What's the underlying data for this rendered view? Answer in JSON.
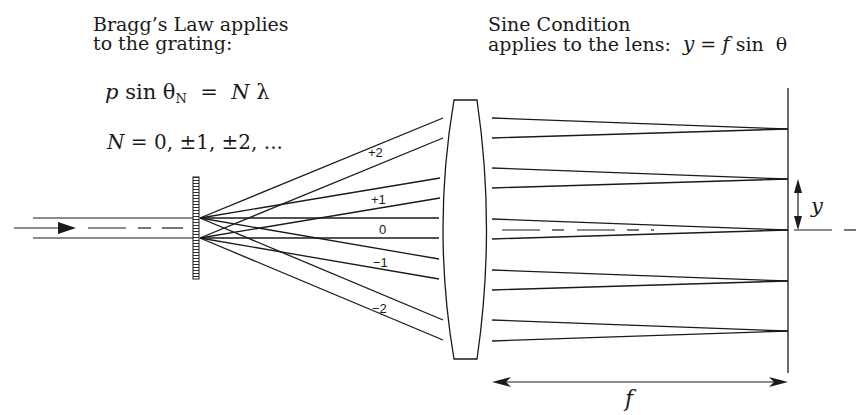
{
  "captions": {
    "bragg_line1": "Bragg’s Law applies",
    "bragg_line2": "to the grating:",
    "sine_line1": "Sine Condition",
    "sine_line2": "applies to the lens:"
  },
  "equations": {
    "bragg": {
      "p": "p",
      "sin": "sin",
      "theta": "θ",
      "sub": "N",
      "equals": "=",
      "N": "N",
      "lambda": "λ"
    },
    "orders": {
      "N": "N",
      "rest": " = 0, ±1, ±2, ..."
    },
    "sine": {
      "y": "y",
      "equals": " = ",
      "f": "f",
      "sin": " sin  θ"
    }
  },
  "order_labels": [
    {
      "text": "+2",
      "x": 368,
      "y": 146
    },
    {
      "text": "+1",
      "x": 371,
      "y": 193
    },
    {
      "text": "0",
      "x": 379,
      "y": 223
    },
    {
      "text": "−1",
      "x": 373,
      "y": 256
    },
    {
      "text": "−2",
      "x": 372,
      "y": 302
    }
  ],
  "dimension_labels": {
    "y": "y",
    "f": "f"
  },
  "colors": {
    "line": "#1a1a1a",
    "background": "#ffffff"
  },
  "geometry": {
    "axis_y": 228,
    "beam_top_y": 218,
    "beam_bottom_y": 238,
    "grating": {
      "x": 193,
      "y": 177,
      "w": 6,
      "h": 102
    },
    "lens": {
      "top_y": 100,
      "bottom_y": 359,
      "flat_left": 454,
      "flat_right": 477,
      "mid_left": 438,
      "mid_right": 492
    },
    "focal_plane": {
      "x": 788,
      "top_y": 88,
      "bottom_y": 373
    },
    "orders": [
      {
        "order": 2,
        "left_end": [
          [
            443,
            118
          ],
          [
            443,
            138
          ]
        ],
        "right_start": [
          [
            492,
            118
          ],
          [
            492,
            138
          ]
        ],
        "focus_y": 129
      },
      {
        "order": 1,
        "left_end": [
          [
            440,
            178
          ],
          [
            440,
            198
          ]
        ],
        "right_start": [
          [
            492,
            168
          ],
          [
            492,
            188
          ]
        ],
        "focus_y": 179
      },
      {
        "order": 0,
        "left_end": [
          [
            439,
            218
          ],
          [
            439,
            238
          ]
        ],
        "right_start": [
          [
            492,
            219
          ],
          [
            492,
            239
          ]
        ],
        "focus_y": 230
      },
      {
        "order": -1,
        "left_end": [
          [
            439,
            259
          ],
          [
            439,
            279
          ]
        ],
        "right_start": [
          [
            492,
            270
          ],
          [
            492,
            290
          ]
        ],
        "focus_y": 281
      },
      {
        "order": -2,
        "left_end": [
          [
            443,
            320
          ],
          [
            443,
            340
          ]
        ],
        "right_start": [
          [
            492,
            320
          ],
          [
            492,
            341
          ]
        ],
        "focus_y": 331
      }
    ]
  }
}
